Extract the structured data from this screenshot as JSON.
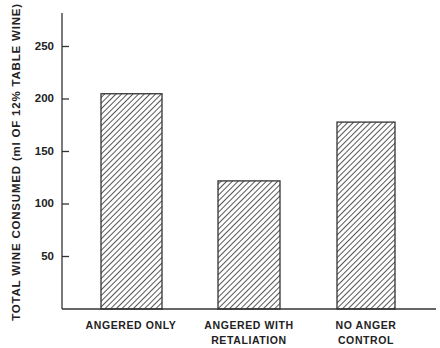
{
  "chart_data": {
    "type": "bar",
    "title": "",
    "xlabel": "",
    "ylabel": "TOTAL WINE CONSUMED (ml OF 12% TABLE WINE)",
    "categories": [
      "ANGERED ONLY",
      "ANGERED WITH RETALIATION",
      "NO ANGER CONTROL"
    ],
    "category_lines": [
      [
        "ANGERED ONLY"
      ],
      [
        "ANGERED WITH",
        "RETALIATION"
      ],
      [
        "NO ANGER",
        "CONTROL"
      ]
    ],
    "values": [
      205,
      122,
      178
    ],
    "ylim": [
      0,
      280
    ],
    "yticks": [
      50,
      100,
      150,
      200,
      250
    ],
    "grid": false,
    "legend": null,
    "bar_fill": "diagonal-hatch",
    "colors": {
      "axis": "#333333",
      "bar_edge": "#333333",
      "hatch": "#444444",
      "background": "#ffffff"
    }
  }
}
